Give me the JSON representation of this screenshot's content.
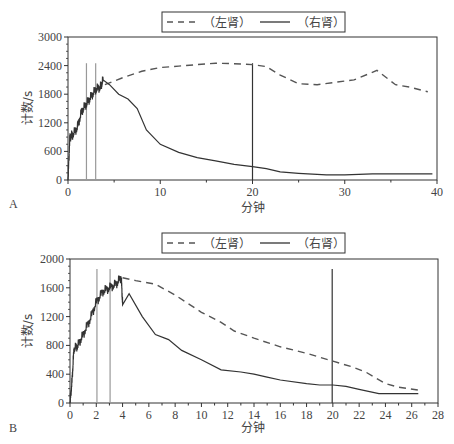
{
  "chart_data": [
    {
      "panel": "A",
      "type": "line",
      "title": "",
      "xlabel": "分钟",
      "ylabel": "计数/s",
      "xlim": [
        0,
        40
      ],
      "ylim": [
        0,
        3000
      ],
      "xticks": [
        0,
        10,
        20,
        30,
        40
      ],
      "yticks": [
        0,
        600,
        1200,
        1800,
        2400,
        3000
      ],
      "grid": false,
      "legend_position": "top-center",
      "legend": [
        "（左肾）",
        "（右肾）"
      ],
      "vertical_markers": [
        {
          "x": 2,
          "y_top": 2450,
          "color": "#999999"
        },
        {
          "x": 3,
          "y_top": 2450,
          "color": "#999999"
        },
        {
          "x": 20,
          "y_top": 2450,
          "color": "#333333"
        }
      ],
      "series": [
        {
          "name": "（左肾）",
          "style": "dashed",
          "x": [
            4,
            6,
            8,
            10,
            12,
            14,
            16,
            18,
            20,
            21.5,
            23,
            25,
            27,
            29,
            31,
            33.5,
            35.5,
            37,
            39
          ],
          "y": [
            2000,
            2150,
            2280,
            2360,
            2390,
            2420,
            2450,
            2440,
            2420,
            2380,
            2200,
            2020,
            2000,
            2050,
            2100,
            2300,
            2000,
            1950,
            1850
          ]
        },
        {
          "name": "（右肾）",
          "style": "solid",
          "x": [
            0,
            0.2,
            0.5,
            1,
            1.5,
            2,
            2.5,
            3,
            3.5,
            3.8,
            4.5,
            5.5,
            6.5,
            7.5,
            8.5,
            10,
            12,
            14,
            16,
            18,
            20,
            21.5,
            23,
            25,
            28,
            30,
            33,
            36,
            39.5
          ],
          "y": [
            0,
            900,
            950,
            1100,
            1450,
            1600,
            1750,
            1900,
            1950,
            2100,
            2000,
            1800,
            1700,
            1500,
            1050,
            750,
            580,
            470,
            400,
            330,
            280,
            240,
            170,
            140,
            110,
            110,
            130,
            130,
            130
          ]
        }
      ]
    },
    {
      "panel": "B",
      "type": "line",
      "title": "",
      "xlabel": "分钟",
      "ylabel": "计数/s",
      "xlim": [
        0,
        28
      ],
      "ylim": [
        0,
        2000
      ],
      "xticks": [
        0,
        2,
        4,
        6,
        8,
        10,
        12,
        14,
        16,
        18,
        20,
        22,
        24,
        26,
        28
      ],
      "yticks": [
        0,
        400,
        800,
        1200,
        1600,
        2000
      ],
      "grid": false,
      "legend_position": "top-center",
      "legend": [
        "（左肾）",
        "（右肾）"
      ],
      "vertical_markers": [
        {
          "x": 2.05,
          "y_top": 1860,
          "color": "#999999"
        },
        {
          "x": 3.05,
          "y_top": 1860,
          "color": "#999999"
        },
        {
          "x": 19.95,
          "y_top": 1860,
          "color": "#333333"
        }
      ],
      "series": [
        {
          "name": "（左肾）",
          "style": "dashed",
          "x": [
            4,
            5,
            6.5,
            8,
            10,
            11.5,
            12.5,
            14,
            16,
            18,
            20,
            21.5,
            22.5,
            24,
            25,
            26.5
          ],
          "y": [
            1740,
            1700,
            1650,
            1500,
            1260,
            1120,
            1000,
            900,
            780,
            690,
            580,
            500,
            430,
            270,
            220,
            180
          ],
          "color": "#666666"
        },
        {
          "name": "（右肾）",
          "style": "solid",
          "x": [
            0,
            0.15,
            0.3,
            0.6,
            1,
            1.5,
            2,
            2.5,
            3,
            3.5,
            3.9,
            4,
            4.5,
            5.5,
            6.5,
            7.5,
            8.5,
            10,
            11.5,
            13,
            14,
            15,
            16,
            18,
            19,
            20,
            21,
            22,
            23.5,
            26.5
          ],
          "y": [
            0,
            300,
            750,
            800,
            950,
            1150,
            1400,
            1550,
            1600,
            1650,
            1750,
            1380,
            1520,
            1200,
            950,
            880,
            730,
            600,
            460,
            430,
            400,
            360,
            320,
            270,
            250,
            250,
            230,
            190,
            130,
            130
          ]
        }
      ]
    }
  ],
  "panels": {
    "a_label": "A",
    "b_label": "B"
  },
  "colors": {
    "line_dark": "#333333",
    "line_dashed": "#555555",
    "marker_light": "#9a9a9a",
    "axis": "#333333"
  }
}
